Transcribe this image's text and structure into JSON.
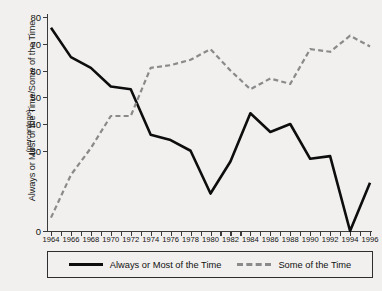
{
  "axis": {
    "y_title": "Always or Most of the Time/Some of the Time",
    "y_subtitle": "(percentage)"
  },
  "legend": {
    "items": [
      {
        "label": "Always or Most of the Time",
        "style": "solid",
        "color": "#0d0d0d"
      },
      {
        "label": "Some of the Time",
        "style": "dashed",
        "color": "#8a8a8a"
      }
    ]
  },
  "chart_data": {
    "type": "line",
    "title": "",
    "xlabel": "",
    "ylabel": "Always or Most of the Time/Some of the Time (percentage)",
    "xlim": [
      1964,
      1996
    ],
    "ylim": [
      0,
      80
    ],
    "yticks": [
      0,
      30,
      40,
      50,
      60,
      70,
      80
    ],
    "ytick_labels": [
      "0",
      "30",
      "40",
      "50",
      "60",
      "70",
      "80"
    ],
    "xticks": [
      1964,
      1965,
      1966,
      1967,
      1968,
      1969,
      1970,
      1971,
      1972,
      1973,
      1974,
      1975,
      1976,
      1977,
      1978,
      1979,
      1980,
      1981,
      1982,
      1983,
      1984,
      1985,
      1986,
      1987,
      1988,
      1989,
      1990,
      1991,
      1992,
      1993,
      1994,
      1995,
      1996
    ],
    "xtick_labels": [
      "1964",
      "1966",
      "1968",
      "1970",
      "1972",
      "1974",
      "1976",
      "1978",
      "1980",
      "1982",
      "1984",
      "1986",
      "1988",
      "1990",
      "1992",
      "1994",
      "1996"
    ],
    "xtick_label_values": [
      1964,
      1966,
      1968,
      1970,
      1972,
      1974,
      1976,
      1978,
      1980,
      1982,
      1984,
      1986,
      1988,
      1990,
      1992,
      1994,
      1996
    ],
    "grid": false,
    "legend_position": "bottom",
    "x": [
      1964,
      1966,
      1968,
      1970,
      1972,
      1974,
      1976,
      1978,
      1980,
      1982,
      1984,
      1986,
      1988,
      1990,
      1992,
      1994,
      1996
    ],
    "series": [
      {
        "name": "Always or Most of the Time",
        "style": "solid",
        "color": "#0d0d0d",
        "values": [
          76,
          65,
          61,
          54,
          53,
          36,
          34,
          30,
          14,
          26,
          44,
          37,
          40,
          27,
          28,
          0,
          18
        ]
      },
      {
        "name": "Some of the Time",
        "style": "dashed",
        "color": "#8a8a8a",
        "values": [
          5,
          21,
          31,
          43,
          43,
          61,
          62,
          64,
          68,
          60,
          53,
          57,
          55,
          68,
          67,
          73,
          69
        ]
      }
    ]
  }
}
